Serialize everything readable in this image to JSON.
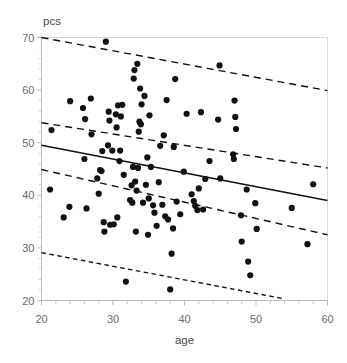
{
  "chart_data": {
    "type": "scatter",
    "title": "",
    "xlabel": "age",
    "ylabel": "pcs",
    "xlim": [
      20,
      60
    ],
    "ylim": [
      20,
      70
    ],
    "xticks": [
      20,
      30,
      40,
      50,
      60
    ],
    "yticks": [
      20,
      30,
      40,
      50,
      60,
      70
    ],
    "xtick_labels": [
      "20",
      "30",
      "40",
      "50",
      "60"
    ],
    "ytick_labels": [
      "20",
      "30",
      "40",
      "50",
      "60",
      "70"
    ],
    "grid": false,
    "legend": null,
    "point_color": "#111111",
    "line_color": "#111111",
    "axis_color": "#b9b9b9",
    "points": [
      [
        21.2,
        41.1
      ],
      [
        21.4,
        52.4
      ],
      [
        23.1,
        35.8
      ],
      [
        23.9,
        37.8
      ],
      [
        24.0,
        57.9
      ],
      [
        25.8,
        56.6
      ],
      [
        26.0,
        46.9
      ],
      [
        26.1,
        54.5
      ],
      [
        26.3,
        37.5
      ],
      [
        26.9,
        58.4
      ],
      [
        27.0,
        51.6
      ],
      [
        27.8,
        43.2
      ],
      [
        28.0,
        40.3
      ],
      [
        28.2,
        44.8
      ],
      [
        28.4,
        44.6
      ],
      [
        28.5,
        48.4
      ],
      [
        28.7,
        34.9
      ],
      [
        28.8,
        33.1
      ],
      [
        29.0,
        69.2
      ],
      [
        29.3,
        49.5
      ],
      [
        29.4,
        55.9
      ],
      [
        29.5,
        54.2
      ],
      [
        29.6,
        34.4
      ],
      [
        29.9,
        48.5
      ],
      [
        30.1,
        34.5
      ],
      [
        30.4,
        55.4
      ],
      [
        30.5,
        52.9
      ],
      [
        30.6,
        35.8
      ],
      [
        30.7,
        57.1
      ],
      [
        30.9,
        46.5
      ],
      [
        31.0,
        48.5
      ],
      [
        31.1,
        55.0
      ],
      [
        31.3,
        57.2
      ],
      [
        31.5,
        43.9
      ],
      [
        31.8,
        23.6
      ],
      [
        32.4,
        39.1
      ],
      [
        32.6,
        41.9
      ],
      [
        32.7,
        38.6
      ],
      [
        32.8,
        45.4
      ],
      [
        32.9,
        62.2
      ],
      [
        33.0,
        63.8
      ],
      [
        33.1,
        42.6
      ],
      [
        33.2,
        33.1
      ],
      [
        33.3,
        40.9
      ],
      [
        33.4,
        65.0
      ],
      [
        33.5,
        45.2
      ],
      [
        33.6,
        52.1
      ],
      [
        33.7,
        54.0
      ],
      [
        33.8,
        60.3
      ],
      [
        33.9,
        53.5
      ],
      [
        34.0,
        57.3
      ],
      [
        34.2,
        38.6
      ],
      [
        34.4,
        58.9
      ],
      [
        34.6,
        42.0
      ],
      [
        34.8,
        47.2
      ],
      [
        34.9,
        32.5
      ],
      [
        35.0,
        39.4
      ],
      [
        35.1,
        55.2
      ],
      [
        35.3,
        45.4
      ],
      [
        35.6,
        38.1
      ],
      [
        35.8,
        36.7
      ],
      [
        36.1,
        34.2
      ],
      [
        36.4,
        42.5
      ],
      [
        36.6,
        49.4
      ],
      [
        36.9,
        38.2
      ],
      [
        37.1,
        51.4
      ],
      [
        37.3,
        36.0
      ],
      [
        37.5,
        58.1
      ],
      [
        37.7,
        35.4
      ],
      [
        38.0,
        22.1
      ],
      [
        38.2,
        28.9
      ],
      [
        38.4,
        33.7
      ],
      [
        38.5,
        49.2
      ],
      [
        38.7,
        62.1
      ],
      [
        38.9,
        38.8
      ],
      [
        39.4,
        36.4
      ],
      [
        39.9,
        44.5
      ],
      [
        40.3,
        55.5
      ],
      [
        41.0,
        40.2
      ],
      [
        41.3,
        38.9
      ],
      [
        41.5,
        38.0
      ],
      [
        41.8,
        37.2
      ],
      [
        42.0,
        41.3
      ],
      [
        42.3,
        55.8
      ],
      [
        42.6,
        37.3
      ],
      [
        42.9,
        43.1
      ],
      [
        43.5,
        46.5
      ],
      [
        44.7,
        54.4
      ],
      [
        44.9,
        64.7
      ],
      [
        45.0,
        43.2
      ],
      [
        46.8,
        47.8
      ],
      [
        46.9,
        46.9
      ],
      [
        47.0,
        58.0
      ],
      [
        47.1,
        54.9
      ],
      [
        47.2,
        52.6
      ],
      [
        47.9,
        36.2
      ],
      [
        48.0,
        31.2
      ],
      [
        48.7,
        41.1
      ],
      [
        48.9,
        27.4
      ],
      [
        49.2,
        24.8
      ],
      [
        49.9,
        38.5
      ],
      [
        50.1,
        33.6
      ],
      [
        55.0,
        37.6
      ],
      [
        57.2,
        30.7
      ],
      [
        58.0,
        42.1
      ]
    ],
    "fit_line": {
      "name": "regression-line",
      "style": "solid",
      "x": [
        20,
        60
      ],
      "y": [
        49.5,
        39.0
      ]
    },
    "bands": [
      {
        "name": "upper-prediction-band",
        "style": "dashed",
        "x": [
          20,
          60
        ],
        "y": [
          70.0,
          59.9
        ]
      },
      {
        "name": "upper-confidence-band",
        "style": "dashed",
        "x": [
          20,
          60
        ],
        "y": [
          53.8,
          45.2
        ]
      },
      {
        "name": "lower-confidence-band",
        "style": "dashed",
        "x": [
          20,
          60
        ],
        "y": [
          44.9,
          32.5
        ]
      },
      {
        "name": "lower-prediction-band",
        "style": "dotted",
        "x": [
          20,
          54
        ],
        "y": [
          29.1,
          20.3
        ]
      }
    ]
  }
}
